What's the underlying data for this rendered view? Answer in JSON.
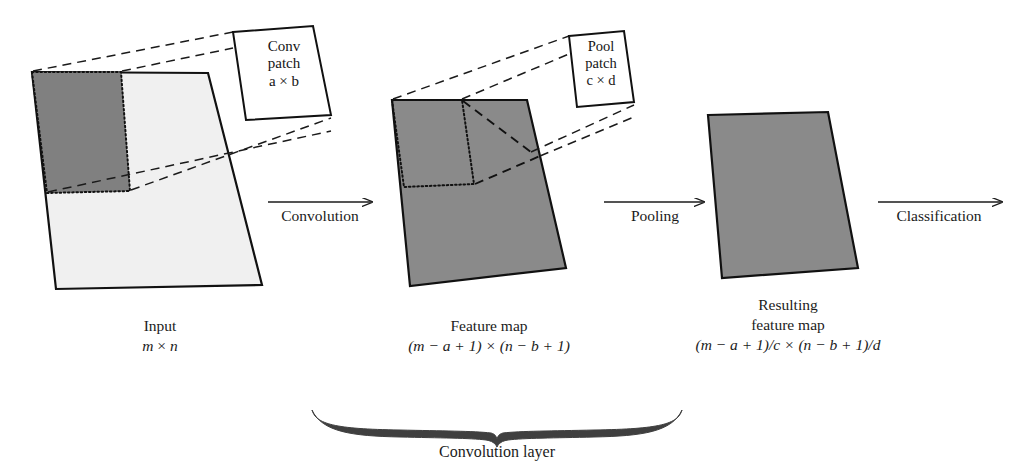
{
  "diagram": {
    "colors": {
      "dark_gray": "#808080",
      "light_gray": "#f0f0f0",
      "mid_gray": "#8a8a8a",
      "stroke": "#111111",
      "text": "#1b1b1b",
      "brace": "#3a3a3a"
    },
    "stages": [
      {
        "id": "input",
        "caption_line1": "Input",
        "caption_line2_a": "m",
        "caption_line2_sep": " × ",
        "caption_line2_b": "n"
      },
      {
        "id": "feature-map",
        "caption_line1": "Feature map",
        "caption_line2": "(m − a + 1) × (n − b + 1)"
      },
      {
        "id": "resulting-feature-map",
        "caption_line1": "Resulting",
        "caption_line2": "feature map",
        "caption_line3": "(m − a + 1)/c × (n − b + 1)/d"
      }
    ],
    "patches": [
      {
        "id": "conv-patch",
        "line1": "Conv",
        "line2": "patch",
        "line3_a": "a",
        "line3_sep": " × ",
        "line3_b": "b"
      },
      {
        "id": "pool-patch",
        "line1": "Pool",
        "line2": "patch",
        "line3_a": "c",
        "line3_sep": " × ",
        "line3_b": "d"
      }
    ],
    "arrows": [
      {
        "id": "convolution-arrow",
        "label": "Convolution"
      },
      {
        "id": "pooling-arrow",
        "label": "Pooling"
      },
      {
        "id": "classification-arrow",
        "label": "Classification"
      }
    ],
    "brace": {
      "id": "convolution-layer-brace",
      "label": "Convolution layer"
    }
  }
}
